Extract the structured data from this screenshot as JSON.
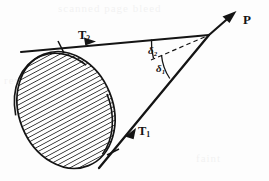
{
  "figure": {
    "background_color": "#fdfdfd",
    "ink_color": "#141414",
    "labels": {
      "apex": "P",
      "tangent_upper_base": "T",
      "tangent_upper_sub": "2",
      "tangent_lower_base": "T",
      "tangent_lower_sub": "1",
      "angle_upper_base": "δ",
      "angle_upper_sub": "2",
      "angle_lower_base": "δ",
      "angle_lower_sub": "1"
    },
    "ghost_text": {
      "top": "scanned page bleed",
      "middle": "reverse side text",
      "bottom": "faint"
    },
    "geometry": {
      "apex_point": [
        209,
        35
      ],
      "arrow_tip": [
        231,
        16
      ],
      "upper_tangent_from": [
        21,
        52
      ],
      "upper_tangent_to": [
        209,
        35
      ],
      "lower_tangent_from": [
        99,
        168
      ],
      "lower_tangent_to": [
        209,
        35
      ],
      "dashed_axis_from": [
        152,
        59
      ],
      "dashed_axis_to": [
        207,
        36
      ],
      "ellipse_center": [
        66,
        110
      ],
      "ellipse_rx": 47,
      "ellipse_ry": 60,
      "ellipse_rotation_deg": -22,
      "hatch_angle_deg": 62,
      "hatch_spacing_px": 4.2,
      "arc_upper_radius": 58,
      "arc_lower_radius": 49,
      "tick_upper_at": [
        61,
        45
      ],
      "arrowhead_upper_at": [
        91,
        42
      ],
      "tick_lower_at": [
        113,
        152
      ],
      "arrowhead_lower_at": [
        131,
        134
      ]
    }
  }
}
